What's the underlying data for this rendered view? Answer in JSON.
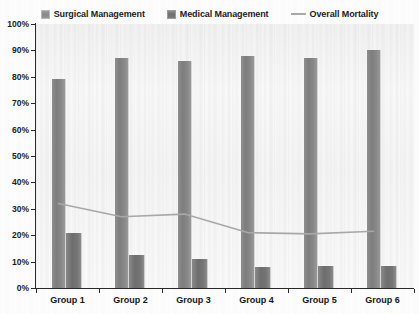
{
  "legend": {
    "items": [
      {
        "label": "Surgical Management",
        "marker": "square-swatch-icon",
        "color": "#848484"
      },
      {
        "label": "Medical Management",
        "marker": "square-swatch-icon",
        "color": "#717171"
      },
      {
        "label": "Overall Mortality",
        "marker": "line-swatch-icon",
        "color": "#a9a9a9"
      }
    ]
  },
  "axis": {
    "y_ticks": [
      "100%",
      "90%",
      "80%",
      "70%",
      "60%",
      "50%",
      "40%",
      "30%",
      "20%",
      "10%",
      "0%"
    ],
    "x_ticks": [
      "Group 1",
      "Group 2",
      "Group 3",
      "Group 4",
      "Group 5",
      "Group 6"
    ]
  },
  "chart_data": {
    "type": "bar",
    "title": "",
    "subtitle": "",
    "xlabel": "",
    "ylabel": "",
    "ylim": [
      0,
      100
    ],
    "ytick_values": [
      0,
      10,
      20,
      30,
      40,
      50,
      60,
      70,
      80,
      90,
      100
    ],
    "ytick_labels": [
      "0%",
      "10%",
      "20%",
      "30%",
      "40%",
      "50%",
      "60%",
      "70%",
      "80%",
      "90%",
      "100%"
    ],
    "grid": false,
    "legend_position": "top-center",
    "categories": [
      "Group 1",
      "Group 2",
      "Group 3",
      "Group 4",
      "Group 5",
      "Group 6"
    ],
    "series": [
      {
        "name": "Surgical Management",
        "kind": "bar",
        "color": "#848484",
        "values": [
          79,
          87,
          86,
          88,
          87,
          90
        ]
      },
      {
        "name": "Medical Management",
        "kind": "bar",
        "color": "#717171",
        "values": [
          21,
          12.5,
          11,
          8,
          8.5,
          8.5
        ]
      },
      {
        "name": "Overall Mortality",
        "kind": "line",
        "color": "#a9a9a9",
        "values": [
          32,
          27,
          28,
          21,
          20.5,
          21.5
        ]
      }
    ]
  }
}
